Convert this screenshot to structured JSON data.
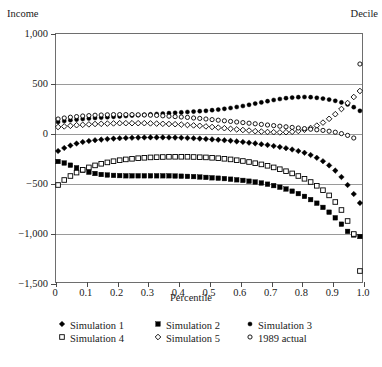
{
  "figure": {
    "cut_caption": "                                                                                     ",
    "y_axis_title": "Income",
    "right_axis_title": "Decile",
    "x_axis_title": "Percentile"
  },
  "chart_data": {
    "type": "scatter",
    "title": "",
    "xlabel": "Percentile",
    "ylabel": "Income",
    "right_label": "Decile",
    "xlim": [
      0.0,
      1.0
    ],
    "ylim": [
      -1500,
      1000
    ],
    "grid": true,
    "legend_position": "bottom",
    "xticks": [
      0,
      0.1,
      0.2,
      0.3,
      0.4,
      0.5,
      0.6,
      0.7,
      0.8,
      0.9,
      1.0
    ],
    "xticklabels": [
      "0",
      "0.1",
      "0.2",
      "0.3",
      "0.4",
      "0.5",
      "0.6",
      "0.7",
      "0.8",
      "0.9",
      "1.0"
    ],
    "yticks": [
      -1500,
      -1000,
      -500,
      0,
      500,
      1000
    ],
    "yticklabels": [
      "−1,500",
      "−1,000",
      "−500",
      "0",
      "500",
      "1,000"
    ],
    "x": [
      0.01,
      0.03,
      0.05,
      0.07,
      0.09,
      0.11,
      0.13,
      0.15,
      0.17,
      0.19,
      0.21,
      0.23,
      0.25,
      0.27,
      0.29,
      0.31,
      0.33,
      0.35,
      0.37,
      0.39,
      0.41,
      0.43,
      0.45,
      0.47,
      0.49,
      0.51,
      0.53,
      0.55,
      0.57,
      0.59,
      0.61,
      0.63,
      0.65,
      0.67,
      0.69,
      0.71,
      0.73,
      0.75,
      0.77,
      0.79,
      0.81,
      0.83,
      0.85,
      0.87,
      0.89,
      0.91,
      0.93,
      0.95,
      0.97,
      0.99
    ],
    "series": [
      {
        "name": "Simulation 1",
        "marker": "filled-diamond",
        "color": "#000000",
        "values": [
          -180,
          -150,
          -125,
          -105,
          -90,
          -80,
          -72,
          -66,
          -60,
          -56,
          -52,
          -50,
          -48,
          -46,
          -45,
          -44,
          -44,
          -44,
          -45,
          -46,
          -48,
          -50,
          -53,
          -56,
          -60,
          -64,
          -68,
          -73,
          -78,
          -84,
          -90,
          -97,
          -104,
          -112,
          -120,
          -130,
          -140,
          -152,
          -165,
          -180,
          -198,
          -220,
          -248,
          -282,
          -324,
          -376,
          -440,
          -520,
          -610,
          -700
        ]
      },
      {
        "name": "Simulation 2",
        "marker": "filled-square",
        "color": "#000000",
        "values": [
          -285,
          -300,
          -322,
          -348,
          -372,
          -392,
          -405,
          -415,
          -420,
          -424,
          -426,
          -428,
          -428,
          -428,
          -428,
          -428,
          -428,
          -428,
          -428,
          -430,
          -432,
          -434,
          -436,
          -440,
          -444,
          -448,
          -452,
          -456,
          -462,
          -468,
          -474,
          -482,
          -490,
          -500,
          -512,
          -526,
          -542,
          -560,
          -582,
          -606,
          -634,
          -666,
          -702,
          -744,
          -792,
          -848,
          -912,
          -984,
          -1020,
          -1035
        ]
      },
      {
        "name": "Simulation 3",
        "marker": "filled-circle",
        "color": "#000000",
        "values": [
          110,
          120,
          128,
          134,
          140,
          145,
          150,
          154,
          158,
          162,
          166,
          170,
          174,
          178,
          182,
          186,
          190,
          194,
          198,
          202,
          206,
          210,
          214,
          218,
          222,
          228,
          234,
          242,
          250,
          260,
          270,
          282,
          294,
          306,
          318,
          330,
          340,
          348,
          354,
          358,
          360,
          358,
          352,
          344,
          334,
          322,
          306,
          286,
          258,
          222
        ]
      },
      {
        "name": "Simulation 4",
        "marker": "open-square",
        "color": "#000000",
        "values": [
          -520,
          -470,
          -430,
          -396,
          -368,
          -344,
          -324,
          -308,
          -294,
          -282,
          -272,
          -264,
          -258,
          -252,
          -248,
          -244,
          -242,
          -240,
          -238,
          -238,
          -238,
          -238,
          -240,
          -242,
          -244,
          -248,
          -252,
          -258,
          -264,
          -272,
          -280,
          -290,
          -302,
          -314,
          -328,
          -344,
          -362,
          -382,
          -404,
          -430,
          -458,
          -490,
          -528,
          -572,
          -624,
          -690,
          -770,
          -880,
          -1010,
          -1380
        ]
      },
      {
        "name": "Simulation 5",
        "marker": "open-diamond",
        "color": "#000000",
        "values": [
          60,
          66,
          72,
          78,
          82,
          86,
          90,
          92,
          94,
          96,
          98,
          98,
          98,
          98,
          98,
          96,
          94,
          92,
          90,
          88,
          84,
          80,
          76,
          72,
          66,
          60,
          54,
          48,
          42,
          36,
          30,
          24,
          18,
          14,
          10,
          8,
          6,
          8,
          12,
          20,
          32,
          50,
          74,
          104,
          142,
          188,
          240,
          300,
          360,
          420
        ]
      },
      {
        "name": "1989 actual",
        "marker": "open-circle",
        "color": "#000000",
        "values": [
          140,
          150,
          158,
          164,
          170,
          174,
          178,
          180,
          182,
          184,
          184,
          184,
          184,
          182,
          180,
          178,
          176,
          172,
          168,
          164,
          160,
          156,
          150,
          146,
          140,
          134,
          128,
          122,
          116,
          110,
          104,
          98,
          92,
          86,
          80,
          74,
          68,
          62,
          56,
          50,
          44,
          38,
          32,
          26,
          18,
          8,
          -6,
          -24,
          -50,
          690
        ]
      }
    ]
  },
  "legend": {
    "row1": [
      {
        "label": "Simulation 1",
        "marker": "filled-diamond"
      },
      {
        "label": "Simulation 2",
        "marker": "filled-square"
      },
      {
        "label": "Simulation 3",
        "marker": "filled-circle"
      }
    ],
    "row2": [
      {
        "label": "Simulation 4",
        "marker": "open-square"
      },
      {
        "label": "Simulation 5",
        "marker": "open-diamond"
      },
      {
        "label": "1989 actual",
        "marker": "open-circle"
      }
    ]
  }
}
